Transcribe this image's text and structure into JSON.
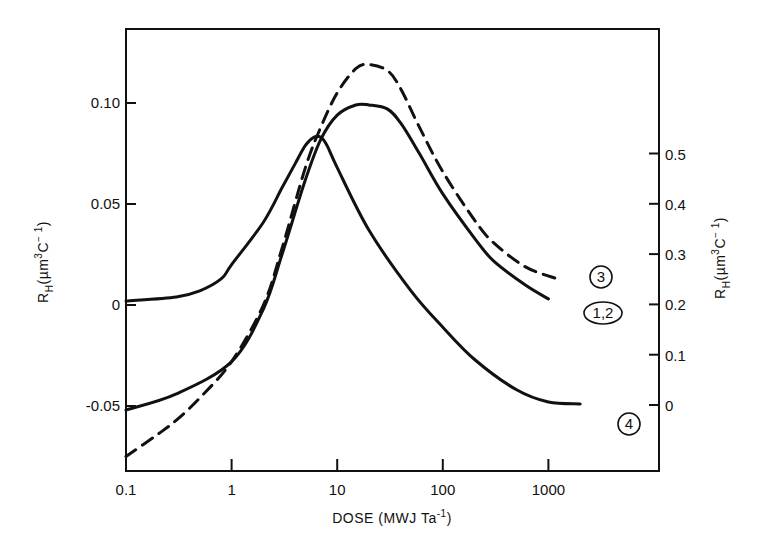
{
  "chart_data": {
    "type": "line",
    "title": "",
    "xlabel": "DOSE (MWJ Ta⁻¹)",
    "ylabel_left": "R_H(µm³C⁻¹)",
    "ylabel_right": "R_H(µm³C⁻¹)",
    "x_scale": "log",
    "xlim": [
      0.1,
      5000
    ],
    "ylim_left": [
      -0.082,
      0.137
    ],
    "ylim_right": [
      -0.1,
      0.78
    ],
    "x_ticks": [
      {
        "value": 0.1,
        "label": "0.1"
      },
      {
        "value": 1,
        "label": "1"
      },
      {
        "value": 10,
        "label": "10"
      },
      {
        "value": 100,
        "label": "100"
      },
      {
        "value": 1000,
        "label": "1000"
      }
    ],
    "y_ticks_left": [
      {
        "value": 0.1,
        "label": "0.10"
      },
      {
        "value": 0.05,
        "label": "0.05"
      },
      {
        "value": 0,
        "label": "0"
      },
      {
        "value": -0.05,
        "label": "-0.05"
      }
    ],
    "y_ticks_right": [
      {
        "value": 0.5,
        "label": "0.5"
      },
      {
        "value": 0.4,
        "label": "0.4"
      },
      {
        "value": 0.3,
        "label": "0.3"
      },
      {
        "value": 0.2,
        "label": "0.2"
      },
      {
        "value": 0.1,
        "label": "0.1"
      },
      {
        "value": 0,
        "label": "0"
      }
    ],
    "grid": false,
    "legend": "inline circled labels at right end of curves",
    "series": [
      {
        "name": "1,2",
        "style": "solid",
        "axis": "left",
        "x": [
          0.1,
          0.3,
          1,
          2,
          3,
          5,
          7,
          10,
          15,
          20,
          30,
          40,
          60,
          100,
          200,
          300,
          600,
          1000
        ],
        "values": [
          -0.052,
          -0.044,
          -0.028,
          -0.002,
          0.025,
          0.062,
          0.082,
          0.094,
          0.099,
          0.099,
          0.097,
          0.09,
          0.075,
          0.055,
          0.033,
          0.022,
          0.01,
          0.003
        ]
      },
      {
        "name": "3",
        "style": "dashed",
        "axis": "left",
        "x": [
          0.1,
          0.2,
          0.3,
          0.5,
          1,
          2,
          3,
          5,
          7,
          10,
          15,
          20,
          30,
          40,
          60,
          100,
          200,
          300,
          600,
          1200
        ],
        "values": [
          -0.075,
          -0.064,
          -0.057,
          -0.046,
          -0.028,
          0.0,
          0.028,
          0.068,
          0.088,
          0.105,
          0.117,
          0.119,
          0.116,
          0.107,
          0.088,
          0.066,
          0.042,
          0.031,
          0.019,
          0.013
        ]
      },
      {
        "name": "4",
        "style": "solid",
        "axis": "left",
        "x": [
          0.1,
          0.3,
          0.5,
          0.8,
          1,
          2,
          3,
          4,
          5,
          6,
          7,
          8,
          10,
          20,
          50,
          100,
          200,
          500,
          1000,
          2000
        ],
        "values": [
          0.002,
          0.004,
          0.007,
          0.013,
          0.02,
          0.041,
          0.058,
          0.07,
          0.079,
          0.083,
          0.083,
          0.079,
          0.068,
          0.037,
          0.007,
          -0.011,
          -0.027,
          -0.042,
          -0.048,
          -0.049
        ]
      }
    ]
  },
  "labels": {
    "x_axis_title_prefix": "DOSE  (MWJ  Ta",
    "x_axis_title_sup": "-1",
    "x_axis_title_suffix": ")",
    "y_axis_title_main": "R",
    "y_axis_title_sub": "H",
    "y_axis_title_rest": "(µm",
    "y_axis_title_sup1": "3",
    "y_axis_title_c": "C",
    "y_axis_title_sup2": "− 1",
    "y_axis_title_end": ")",
    "curve_labels": [
      "3",
      "1,2",
      "4"
    ]
  }
}
